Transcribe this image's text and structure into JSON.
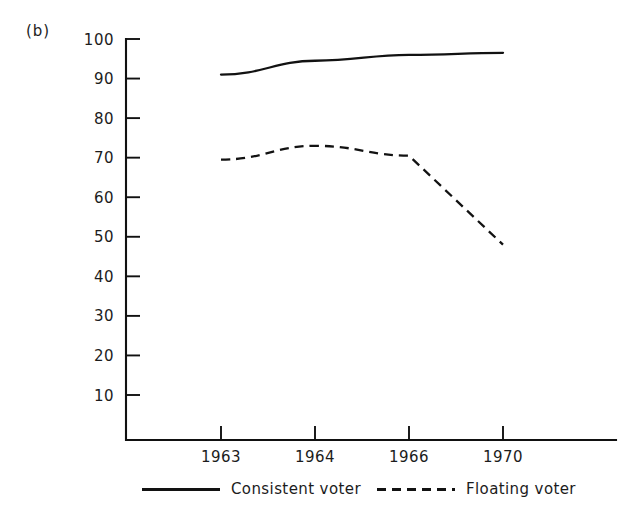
{
  "figure": {
    "panel_label": "(b)",
    "background_color": "#ffffff",
    "ink_color": "#121212"
  },
  "chart_data": {
    "type": "line",
    "title": "",
    "subtitle": "",
    "xlabel": "",
    "ylabel": "",
    "categories": [
      "1963",
      "1964",
      "1966",
      "1970"
    ],
    "x_tick_labels": [
      "1963",
      "1964",
      "1966",
      "1970"
    ],
    "y_tick_labels": [
      "10",
      "20",
      "30",
      "40",
      "50",
      "60",
      "70",
      "80",
      "90",
      "100"
    ],
    "y_ticks": [
      10,
      20,
      30,
      40,
      50,
      60,
      70,
      80,
      90,
      100
    ],
    "ylim": [
      0,
      100
    ],
    "grid": false,
    "legend_position": "below-axes",
    "series": [
      {
        "name": "Consistent voter",
        "style": "solid",
        "color": "#121212",
        "values": [
          91,
          94.5,
          96,
          96.5
        ]
      },
      {
        "name": "Floating voter",
        "style": "dashed",
        "color": "#121212",
        "values": [
          69.5,
          73,
          70.5,
          48
        ]
      }
    ]
  },
  "legend": {
    "entries": [
      {
        "label": "Consistent voter",
        "style": "solid"
      },
      {
        "label": "Floating voter",
        "style": "dashed"
      }
    ]
  }
}
